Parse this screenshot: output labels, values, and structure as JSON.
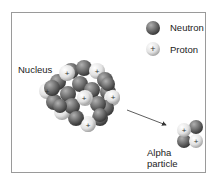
{
  "diagram": {
    "legend": {
      "neutron_label": "Neutron",
      "proton_label": "Proton",
      "proton_symbol": "+"
    },
    "labels": {
      "nucleus": "Nucleus",
      "alpha_line1": "Alpha",
      "alpha_line2": "particle"
    },
    "colors": {
      "neutron": "#6e6e6e",
      "proton": "#e6e6e6",
      "frame": "#9a9a9a",
      "arrow": "#333333"
    }
  }
}
